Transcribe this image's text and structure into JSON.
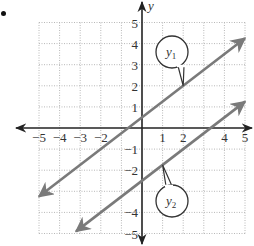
{
  "chart_data": {
    "type": "line",
    "title": "",
    "xlabel": "",
    "ylabel": "y",
    "xlim": [
      -5,
      5
    ],
    "ylim": [
      -5,
      5
    ],
    "grid": true,
    "grid_style": "dotted",
    "x_ticks": [
      -5,
      -4,
      -3,
      -2,
      1,
      2,
      4,
      5
    ],
    "x_tick_labels": [
      "−5",
      "−4",
      "−3",
      "−2",
      "1",
      "2",
      "4",
      "5"
    ],
    "y_ticks": [
      5,
      4,
      3,
      2,
      1,
      -1,
      -2,
      -4,
      -5
    ],
    "y_tick_labels": [
      "5",
      "4",
      "3",
      "2",
      "1",
      "−1",
      "−2",
      "−4",
      "−5"
    ],
    "series": [
      {
        "name": "y1",
        "label_main": "y",
        "label_sub": "1",
        "slope": 0.75,
        "intercept": 0.5,
        "x": [
          -5,
          5
        ],
        "y": [
          -3.25,
          4.25
        ],
        "callout_point": [
          2,
          2
        ],
        "color": "#7a7a7a"
      },
      {
        "name": "y2",
        "label_main": "y",
        "label_sub": "2",
        "slope": 0.75,
        "intercept": -2.5,
        "x": [
          -3.2,
          5
        ],
        "y": [
          -4.9,
          1.25
        ],
        "callout_point": [
          1,
          -1.75
        ],
        "color": "#7a7a7a"
      }
    ],
    "axis_color": "#222222",
    "grid_color": "#b8b8b8"
  }
}
